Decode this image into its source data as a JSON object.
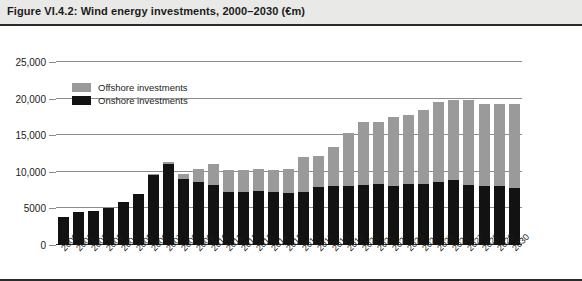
{
  "header": {
    "title": "Figure VI.4.2: Wind energy investments, 2000–2030 (€m)"
  },
  "legend": {
    "items": [
      {
        "label": "Offshore investments",
        "color": "#9a9a9a",
        "key": "offshore"
      },
      {
        "label": "Onshore investments",
        "color": "#121212",
        "key": "onshore"
      }
    ]
  },
  "chart_data": {
    "type": "bar",
    "title": "Figure VI.4.2: Wind energy investments, 2000–2030 (€m)",
    "xlabel": "",
    "ylabel": "",
    "stacked": true,
    "grid": true,
    "legend_position": "inside-top-left",
    "ylim": [
      0,
      25000
    ],
    "yticks": [
      0,
      5000,
      10000,
      15000,
      20000,
      25000
    ],
    "ytick_labels": [
      "0",
      "5000",
      "10,000",
      "15,000",
      "20,000",
      "25,000"
    ],
    "categories": [
      "2000",
      "2001",
      "2002",
      "2003",
      "2004",
      "2005",
      "2006",
      "2007",
      "2008",
      "2009",
      "2010",
      "2011",
      "2012",
      "2013",
      "2014",
      "2015",
      "2016",
      "2017",
      "2018",
      "2019",
      "2020",
      "2021",
      "2022",
      "2023",
      "2024",
      "2025",
      "2026",
      "2027",
      "2028",
      "2029",
      "2030"
    ],
    "series": [
      {
        "name": "Onshore investments",
        "color": "#121212",
        "values": [
          3800,
          4500,
          4700,
          5100,
          5900,
          7000,
          9500,
          11000,
          9000,
          8600,
          8200,
          7200,
          7200,
          7400,
          7200,
          7100,
          7300,
          7900,
          8000,
          8100,
          8200,
          8300,
          8000,
          8300,
          8400,
          8600,
          8900,
          8200,
          8000,
          8000,
          7800
        ]
      },
      {
        "name": "Offshore investments",
        "color": "#9a9a9a",
        "values": [
          0,
          0,
          0,
          0,
          0,
          0,
          200,
          300,
          700,
          1800,
          2900,
          3000,
          3000,
          3000,
          3100,
          3300,
          4700,
          4200,
          5400,
          7200,
          8600,
          8500,
          9500,
          9400,
          10000,
          11000,
          10900,
          11600,
          11300,
          11300,
          11500
        ]
      }
    ],
    "totals": [
      3800,
      4500,
      4700,
      5100,
      5900,
      7000,
      9700,
      11300,
      9700,
      10400,
      11100,
      10200,
      10200,
      10400,
      10300,
      10400,
      12000,
      12100,
      13400,
      15300,
      16800,
      16800,
      17500,
      17700,
      18400,
      19600,
      19800,
      19800,
      19300,
      19300,
      19300
    ]
  }
}
